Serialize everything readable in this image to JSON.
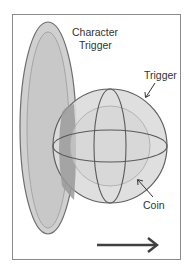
{
  "diagram": {
    "labels": {
      "character_trigger_line1": "Character",
      "character_trigger_line2": "Trigger",
      "trigger": "Trigger",
      "coin": "Coin"
    },
    "colors": {
      "frame": "#8a8a8a",
      "capsule_fill": "#d0d0d0",
      "capsule_stroke": "#6e6e6e",
      "sphere_fill": "#dadada",
      "sphere_stroke": "#606060",
      "overlap": "#9a9a9a",
      "arrow": "#404040"
    },
    "direction_arrow": "right"
  }
}
